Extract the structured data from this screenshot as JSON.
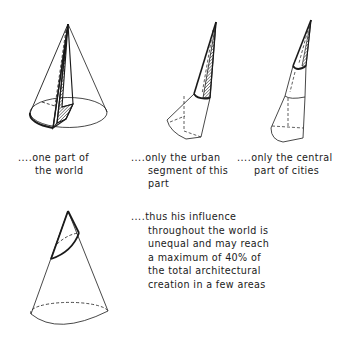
{
  "figure": {
    "panels": [
      {
        "id": "world",
        "caption_prefix": "....",
        "caption_lines": [
          "one part of",
          "the world"
        ]
      },
      {
        "id": "urban",
        "caption_prefix": "....",
        "caption_lines": [
          "only the urban",
          "segment of this",
          "part"
        ]
      },
      {
        "id": "central",
        "caption_prefix": "....",
        "caption_lines": [
          "only the central",
          "part of cities"
        ]
      },
      {
        "id": "influence",
        "caption_prefix": "....",
        "caption_lines": [
          "thus his influence",
          "throughout the world is",
          "unequal and may reach",
          "a maximum of 40% of",
          "the total architectural",
          "creation in a few areas"
        ]
      }
    ],
    "colors": {
      "ink": "#1a1a1a",
      "background": "#ffffff"
    }
  }
}
